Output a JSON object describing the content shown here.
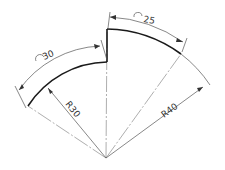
{
  "diagram": {
    "type": "engineering-drawing",
    "apex": {
      "x": 106,
      "y": 158
    },
    "dimensions": {
      "arc_outer": {
        "symbol": "arc-length",
        "value": "25"
      },
      "arc_inner": {
        "symbol": "arc-length",
        "value": "30"
      },
      "radius_inner": {
        "label": "R30"
      },
      "radius_outer": {
        "label": "R40"
      }
    },
    "colors": {
      "outline": "#1a1a1a",
      "dimension": "#555555",
      "background": "#ffffff"
    }
  }
}
